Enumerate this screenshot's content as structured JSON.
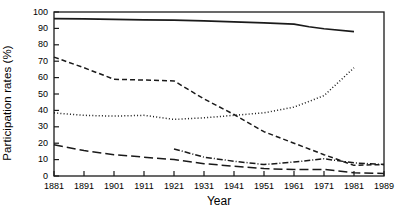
{
  "chart_data": {
    "type": "line",
    "title": "",
    "xlabel": "Year",
    "ylabel": "Participation rates (%)",
    "xlim": [
      1881,
      1989
    ],
    "ylim": [
      0,
      100
    ],
    "grid": false,
    "legend": "none",
    "x_ticks": [
      "1881",
      "1891",
      "1901",
      "1911",
      "1921",
      "1931",
      "1941",
      "1951",
      "1961",
      "1971",
      "1981",
      "1989"
    ],
    "y_ticks": [
      "0",
      "10",
      "20",
      "30",
      "40",
      "50",
      "60",
      "70",
      "80",
      "90",
      "100"
    ],
    "series": [
      {
        "name": "series-solid",
        "style": "solid",
        "color": "#1a1a1a",
        "x": [
          1881,
          1891,
          1901,
          1911,
          1921,
          1931,
          1941,
          1951,
          1961,
          1966,
          1971,
          1981
        ],
        "values": [
          96,
          95.8,
          95.5,
          95.2,
          95,
          94.6,
          94,
          93.4,
          92.6,
          91,
          89.8,
          88
        ]
      },
      {
        "name": "series-short-dash",
        "style": "dashed",
        "color": "#1a1a1a",
        "x": [
          1881,
          1891,
          1901,
          1911,
          1921,
          1931,
          1941,
          1951,
          1961,
          1971,
          1981,
          1989
        ],
        "values": [
          72.5,
          66,
          59,
          58.5,
          58,
          47,
          37.5,
          27,
          20,
          13,
          6.5,
          7
        ]
      },
      {
        "name": "series-dotted",
        "style": "dotted",
        "color": "#1a1a1a",
        "x": [
          1881,
          1891,
          1901,
          1911,
          1921,
          1931,
          1941,
          1951,
          1961,
          1971,
          1981
        ],
        "values": [
          38.5,
          37,
          36.5,
          37,
          34.5,
          35.5,
          37,
          38.5,
          42,
          49,
          66
        ]
      },
      {
        "name": "series-dash-dot",
        "style": "dashdot",
        "color": "#1a1a1a",
        "x": [
          1921,
          1931,
          1941,
          1951,
          1961,
          1971,
          1981,
          1989
        ],
        "values": [
          16.5,
          11.5,
          9,
          7,
          8.5,
          10.5,
          8,
          7
        ]
      },
      {
        "name": "series-long-dash",
        "style": "longdash",
        "color": "#1a1a1a",
        "x": [
          1881,
          1891,
          1901,
          1911,
          1921,
          1931,
          1941,
          1951,
          1961,
          1971,
          1981,
          1989
        ],
        "values": [
          19,
          15.5,
          13,
          11.5,
          10,
          7.5,
          6,
          4.5,
          4,
          4,
          2,
          1.5
        ]
      }
    ]
  },
  "axes": {
    "frame_color": "#1a1a1a"
  }
}
